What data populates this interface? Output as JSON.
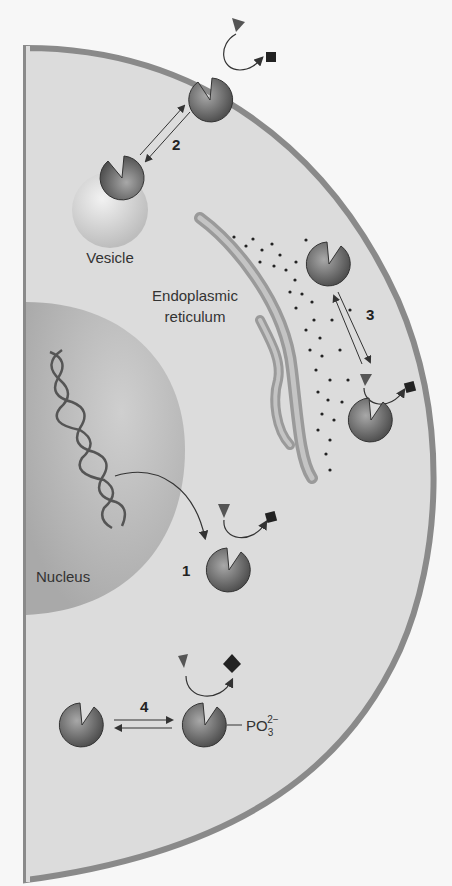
{
  "figure": {
    "labels": {
      "vesicle": "Vesicle",
      "er_line1": "Endoplasmic",
      "er_line2": "reticulum",
      "nucleus": "Nucleus",
      "phosphate_base": "PO",
      "phosphate_sub": "3",
      "phosphate_sup": "2−"
    },
    "steps": {
      "s1": "1",
      "s2": "2",
      "s3": "3",
      "s4": "4"
    },
    "colors": {
      "cytoplasm": "#dcdcdc",
      "membrane": "#8a8a8a",
      "nucleus": "#b8b8b8",
      "enzyme": "#6f6f6f",
      "background": "#f7f7f7"
    }
  }
}
